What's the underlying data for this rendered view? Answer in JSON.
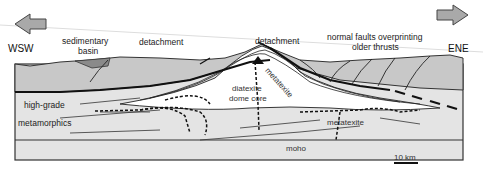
{
  "directions": {
    "west": "WSW",
    "east": "ENE"
  },
  "labels": {
    "sedimentary_basin_line1": "sedimentary",
    "sedimentary_basin_line2": "basin",
    "detachment_left": "detachment",
    "detachment_center": "detachment",
    "normal_faults_line1": "normal faults overprinting",
    "normal_faults_line2": "older thrusts",
    "high_grade": "high-grade",
    "metamorphics": "metamorphics",
    "diatexite_line1": "diatexite",
    "diatexite_line2": "dome core",
    "metatexite_flank": "metatexite",
    "metatexite_right": "metatexite",
    "moho": "moho"
  },
  "scale_bar": {
    "label": "10 km"
  },
  "colors": {
    "upper_crust": "#c8c8c8",
    "basin_fill": "#8a8a8a",
    "lower_crust": "#e4e4e4",
    "dome": "#ffffff",
    "arrow_fill": "#a9a9a9",
    "lines": "#111111"
  }
}
